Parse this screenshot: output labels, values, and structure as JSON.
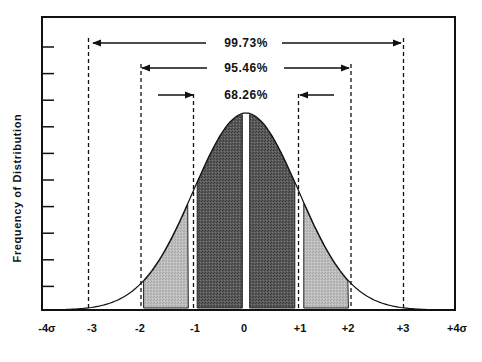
{
  "chart_data": {
    "type": "area",
    "title": "",
    "xlabel": "",
    "ylabel": "Frequency of Distribution",
    "x_ticks": [
      "-4σ",
      "-3",
      "-2",
      "-1",
      "0",
      "+1",
      "+2",
      "+3",
      "+4σ"
    ],
    "x_tick_values": [
      -4,
      -3,
      -2,
      -1,
      0,
      1,
      2,
      3,
      4
    ],
    "xlim": [
      -4,
      4
    ],
    "y_tick_count": 10,
    "y_tick_labels": [],
    "grid": false,
    "curve": "standard normal distribution",
    "regions": [
      {
        "name": "within 1 sigma",
        "range": [
          -1,
          1
        ],
        "percent": "68.26%",
        "fill": "dark"
      },
      {
        "name": "1 to 2 sigma",
        "range": [
          -2,
          -1
        ],
        "percent": "",
        "fill": "light"
      },
      {
        "name": "1 to 2 sigma",
        "range": [
          1,
          2
        ],
        "percent": "",
        "fill": "light"
      }
    ],
    "annotations": [
      {
        "label": "99.73%",
        "range": [
          -3,
          3
        ],
        "arrow": "outward"
      },
      {
        "label": "95.46%",
        "range": [
          -2,
          2
        ],
        "arrow": "outward"
      },
      {
        "label": "68.26%",
        "range": [
          -1,
          1
        ],
        "arrow": "inward"
      }
    ],
    "colors": {
      "dark_fill": "#555555",
      "light_fill": "#b8b8b8",
      "line": "#111111"
    }
  },
  "axis": {
    "ylabel": "Frequency of Distribution",
    "xticks": [
      "-4σ",
      "-3",
      "-2",
      "-1",
      "0",
      "+1",
      "+2",
      "+3",
      "+4σ"
    ]
  },
  "annotations": {
    "a99": "99.73%",
    "a95": "95.46%",
    "a68": "68.26%"
  }
}
